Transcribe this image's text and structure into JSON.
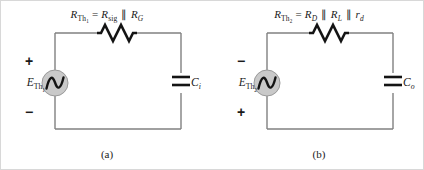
{
  "figure": {
    "background": "#ffffff",
    "wire_color": "#808080",
    "component_color": "#141414",
    "source_fill": "#c9c9c9",
    "source_stroke": "#9a9a9a"
  },
  "circuits": [
    {
      "id": "a",
      "caption": "(a)",
      "resistor": {
        "label_prefix": "R",
        "label_sub": "Th",
        "label_sub_index": "1",
        "equals": "=",
        "term1_main": "R",
        "term1_sub": "sig",
        "parallel": "‖",
        "term2_main": "R",
        "term2_sub": "G",
        "full_text": "R_Th1 = R_sig || R_G"
      },
      "source": {
        "name": "E",
        "sub": "Th",
        "sub_index": "1",
        "sign_top": "+",
        "sign_bottom": "−",
        "symbol": "ac-sine"
      },
      "capacitor": {
        "name": "C",
        "sub": "i"
      }
    },
    {
      "id": "b",
      "caption": "(b)",
      "resistor": {
        "label_prefix": "R",
        "label_sub": "Th",
        "label_sub_index": "2",
        "equals": "=",
        "term1_main": "R",
        "term1_sub": "D",
        "parallel": "‖",
        "term2_main": "R",
        "term2_sub": "L",
        "parallel2": "‖",
        "term3_main": "r",
        "term3_sub": "d",
        "full_text": "R_Th2 = R_D || R_L || r_d"
      },
      "source": {
        "name": "E",
        "sub": "Th",
        "sub_index": "2",
        "sign_top": "−",
        "sign_bottom": "+",
        "symbol": "ac-sine"
      },
      "capacitor": {
        "name": "C",
        "sub": "o"
      }
    }
  ]
}
